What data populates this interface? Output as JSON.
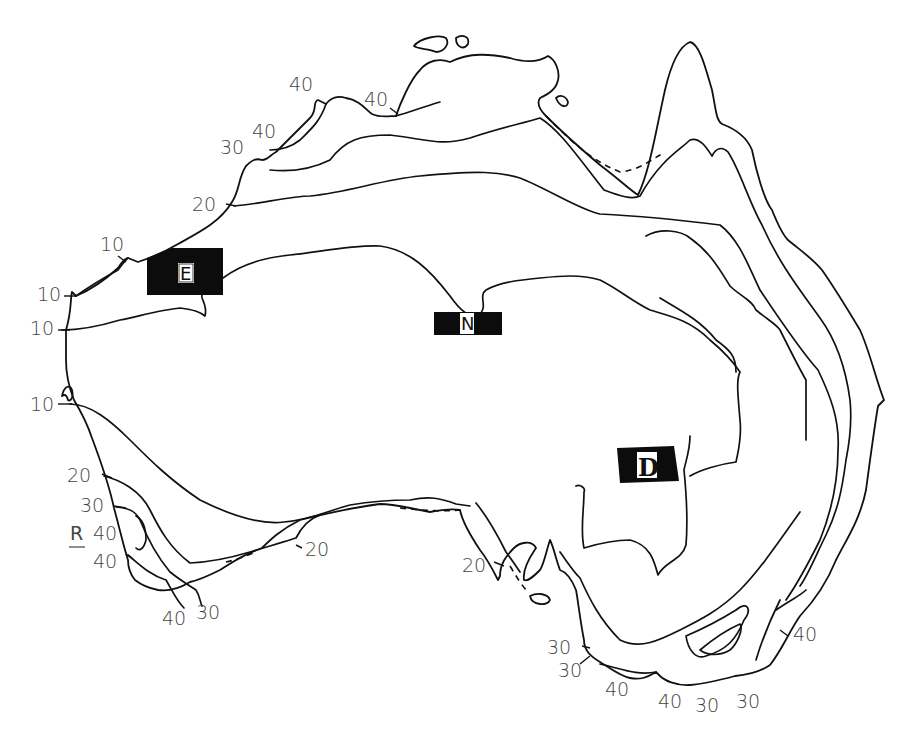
{
  "map": {
    "subject": "Australia",
    "type": "isoline map",
    "line_color": "#111111",
    "background": "#ffffff",
    "region_boxes": [
      {
        "id": "E",
        "letter": "E",
        "x": 147,
        "y": 248,
        "w": 76,
        "h": 47
      },
      {
        "id": "N",
        "letter": "N",
        "x": 434,
        "y": 312,
        "w": 68,
        "h": 23
      },
      {
        "id": "D",
        "letter": "D",
        "x": 617,
        "y": 448,
        "w": 62,
        "h": 33
      }
    ],
    "point_label": {
      "text": "R",
      "underlined": true
    },
    "contour_labels": [
      {
        "text": "40",
        "x": 289,
        "y": 91
      },
      {
        "text": "40",
        "x": 364,
        "y": 106
      },
      {
        "text": "40",
        "x": 252,
        "y": 138
      },
      {
        "text": "30",
        "x": 220,
        "y": 154
      },
      {
        "text": "20",
        "x": 192,
        "y": 211
      },
      {
        "text": "10",
        "x": 100,
        "y": 251
      },
      {
        "text": "10",
        "x": 37,
        "y": 301
      },
      {
        "text": "10",
        "x": 30,
        "y": 335
      },
      {
        "text": "10",
        "x": 30,
        "y": 411
      },
      {
        "text": "20",
        "x": 67,
        "y": 482
      },
      {
        "text": "30",
        "x": 80,
        "y": 512
      },
      {
        "text": "40",
        "x": 93,
        "y": 540
      },
      {
        "text": "40",
        "x": 93,
        "y": 568
      },
      {
        "text": "40",
        "x": 162,
        "y": 625
      },
      {
        "text": "30",
        "x": 196,
        "y": 619
      },
      {
        "text": "20",
        "x": 305,
        "y": 556
      },
      {
        "text": "20",
        "x": 462,
        "y": 572
      },
      {
        "text": "30",
        "x": 547,
        "y": 654
      },
      {
        "text": "30",
        "x": 558,
        "y": 677
      },
      {
        "text": "40",
        "x": 605,
        "y": 696
      },
      {
        "text": "40",
        "x": 658,
        "y": 708
      },
      {
        "text": "30",
        "x": 695,
        "y": 712
      },
      {
        "text": "30",
        "x": 736,
        "y": 708
      },
      {
        "text": "40",
        "x": 793,
        "y": 641
      }
    ],
    "legend_values": [
      "10",
      "20",
      "30",
      "40"
    ]
  }
}
